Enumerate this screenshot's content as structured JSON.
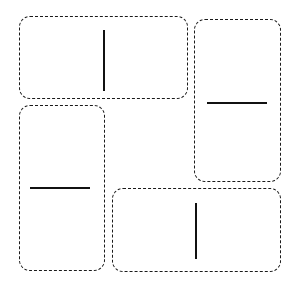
{
  "figure": {
    "width": 299,
    "height": 291,
    "background_color": "#ffffff",
    "panel_border_color": "#1a1a1a",
    "panel_border_style": "dashed",
    "panel_border_width": 1.4,
    "panel_corner_radius": 11,
    "stroke_color": "#111111",
    "stroke_width": 1.6,
    "panel_count": 4,
    "stroke_count": 4
  },
  "panels": [
    {
      "id": "panel-top-left",
      "label": "Top left panel",
      "x": 19,
      "y": 16,
      "width": 169,
      "height": 83,
      "stroke": {
        "id": "stroke-vertical-top-left",
        "label": "Vertical line",
        "orientation": "vertical",
        "x": 103,
        "y": 30,
        "length": 61
      }
    },
    {
      "id": "panel-top-right",
      "label": "Top right panel",
      "x": 194,
      "y": 19,
      "width": 87,
      "height": 163,
      "stroke": {
        "id": "stroke-horizontal-top-right",
        "label": "Horizontal line",
        "orientation": "horizontal",
        "x": 207,
        "y": 102,
        "length": 60
      }
    },
    {
      "id": "panel-bottom-left",
      "label": "Bottom left panel",
      "x": 19,
      "y": 105,
      "width": 86,
      "height": 166,
      "stroke": {
        "id": "stroke-horizontal-bottom-left",
        "label": "Horizontal line",
        "orientation": "horizontal",
        "x": 30,
        "y": 187,
        "length": 60
      }
    },
    {
      "id": "panel-bottom-right",
      "label": "Bottom right panel",
      "x": 112,
      "y": 188,
      "width": 169,
      "height": 84,
      "stroke": {
        "id": "stroke-vertical-bottom-right",
        "label": "Vertical line",
        "orientation": "vertical",
        "x": 195,
        "y": 203,
        "length": 56
      }
    }
  ]
}
